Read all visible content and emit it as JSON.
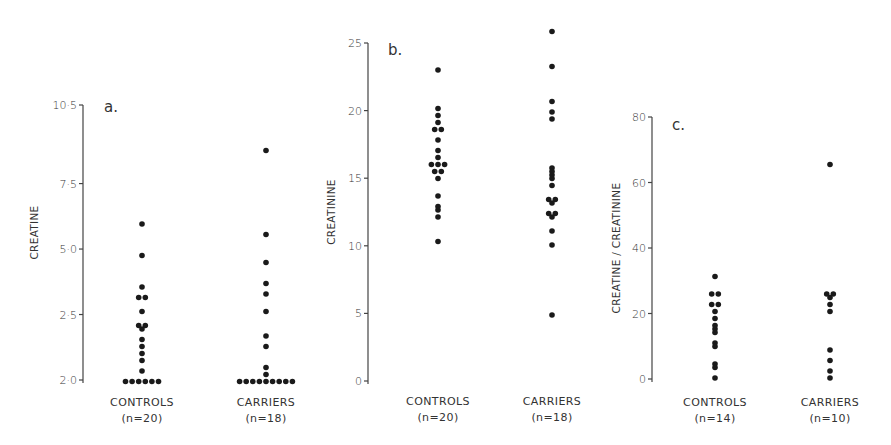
{
  "colors": {
    "dot": "#1a1a1a",
    "axis": "#444444",
    "text": "#333333",
    "background": "#ffffff"
  },
  "chart_data": [
    {
      "type": "scatter",
      "subtype": "dot-strip",
      "panel": "a.",
      "title": "",
      "ylabel": "CREATINE",
      "xlabel": "",
      "ylim": [
        0,
        10.5
      ],
      "yticks": [
        {
          "value": 10.5,
          "label": "10·5"
        },
        {
          "value": 7.5,
          "label": "7·5"
        },
        {
          "value": 5.0,
          "label": "5·0"
        },
        {
          "value": 2.5,
          "label": "2·5"
        },
        {
          "value": 0,
          "label": "2·0"
        }
      ],
      "categories": [
        "CONTROLS",
        "CARRIERS"
      ],
      "category_n": [
        "(n=20)",
        "(n=18)"
      ],
      "grid": false,
      "legend": null,
      "series": [
        {
          "name": "CONTROLS",
          "values": [
            5.9,
            4.8,
            3.5,
            3.2,
            3.2,
            2.6,
            2.1,
            2.1,
            1.9,
            1.6,
            1.3,
            1.0,
            0.7,
            0.3,
            0,
            0,
            0,
            0,
            0,
            0
          ]
        },
        {
          "name": "CARRIERS",
          "values": [
            8.8,
            5.6,
            4.5,
            3.7,
            3.3,
            2.6,
            1.7,
            1.3,
            0.5,
            0.2,
            0,
            0,
            0,
            0,
            0,
            0,
            0,
            0,
            0
          ]
        }
      ]
    },
    {
      "type": "scatter",
      "subtype": "dot-strip",
      "panel": "b.",
      "title": "",
      "ylabel": "CREATININE",
      "xlabel": "",
      "ylim": [
        0,
        25
      ],
      "yticks": [
        {
          "value": 25,
          "label": "25"
        },
        {
          "value": 20,
          "label": "20"
        },
        {
          "value": 15,
          "label": "15"
        },
        {
          "value": 10,
          "label": "10"
        },
        {
          "value": 5,
          "label": "5"
        },
        {
          "value": 0,
          "label": "0"
        }
      ],
      "categories": [
        "CONTROLS",
        "CARRIERS"
      ],
      "category_n": [
        "(n=20)",
        "(n=18)"
      ],
      "grid": false,
      "legend": null,
      "series": [
        {
          "name": "CONTROLS",
          "values": [
            23.1,
            20.1,
            19.6,
            19.1,
            18.7,
            18.7,
            17.7,
            17.0,
            16.5,
            16.0,
            16.0,
            16.0,
            15.6,
            15.6,
            15.0,
            13.6,
            13.0,
            12.6,
            12.1,
            10.3
          ]
        },
        {
          "name": "CARRIERS",
          "values": [
            25.8,
            23.3,
            20.8,
            20.0,
            19.4,
            15.7,
            15.5,
            15.2,
            14.9,
            14.5,
            13.5,
            13.5,
            13.1,
            12.5,
            12.5,
            12.1,
            11.0,
            10.1,
            5.0
          ]
        }
      ]
    },
    {
      "type": "scatter",
      "subtype": "dot-strip",
      "panel": "c.",
      "title": "",
      "ylabel": "CREATINE / CREATININE",
      "xlabel": "",
      "ylim": [
        0,
        80
      ],
      "yticks": [
        {
          "value": 80,
          "label": "80"
        },
        {
          "value": 60,
          "label": "60"
        },
        {
          "value": 40,
          "label": "40"
        },
        {
          "value": 20,
          "label": "20"
        },
        {
          "value": 0,
          "label": "0"
        }
      ],
      "categories": [
        "CONTROLS",
        "CARRIERS"
      ],
      "category_n": [
        "(n=14)",
        "(n=10)"
      ],
      "grid": false,
      "legend": null,
      "series": [
        {
          "name": "CONTROLS",
          "values": [
            31.8,
            26.3,
            26.3,
            22.4,
            22.4,
            20.7,
            18.0,
            16.6,
            15.3,
            14.0,
            11.5,
            9.9,
            5.0,
            3.7,
            0.5
          ]
        },
        {
          "name": "CARRIERS",
          "values": [
            65.6,
            26.0,
            26.0,
            25.0,
            22.5,
            21.0,
            9.0,
            5.5,
            2.3,
            0.0
          ]
        }
      ]
    }
  ],
  "layout": {
    "panels": [
      {
        "axis_x": 83,
        "y_top": 105,
        "y_bottom": 380,
        "cat_x": [
          142,
          266
        ],
        "letter_x": 104,
        "letter_y": 112,
        "ylabel_x": 38,
        "label_y": 406
      },
      {
        "axis_x": 368,
        "y_top": 43,
        "y_bottom": 381,
        "cat_x": [
          438,
          552
        ],
        "letter_x": 388,
        "letter_y": 55,
        "ylabel_x": 335,
        "label_y": 405
      },
      {
        "axis_x": 652,
        "y_top": 117,
        "y_bottom": 379,
        "cat_x": [
          715,
          830
        ],
        "letter_x": 672,
        "letter_y": 130,
        "ylabel_x": 620,
        "label_y": 406
      }
    ]
  }
}
